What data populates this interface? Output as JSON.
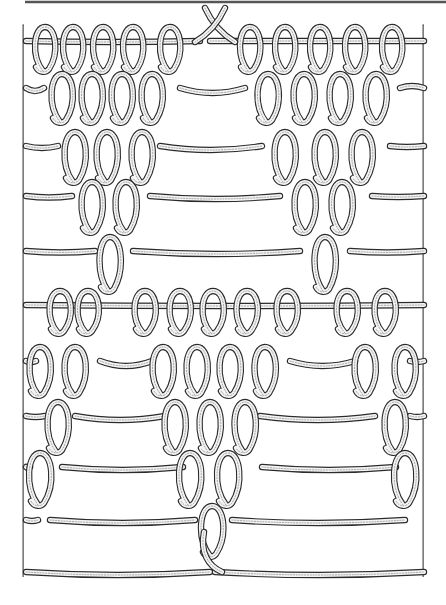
{
  "figure": {
    "type": "stitch-diagram",
    "colors": {
      "background": "#ffffff",
      "outline": "#2b2b2b",
      "fill": "#f4f4f4",
      "shading": "#9a9a9a",
      "rule": "#555555"
    },
    "canvas": {
      "width": 446,
      "height": 605
    },
    "top_rule": {
      "x1": 25,
      "x2": 446,
      "y": 2
    },
    "borders": {
      "left_x": 24,
      "right_x": 424,
      "top_y": 25,
      "bottom_y": 580
    },
    "yarn_width": 4.2,
    "rows": [
      {
        "y": 41,
        "segments": [
          [
            26,
            200,
            2
          ],
          [
            210,
            424,
            0
          ]
        ],
        "loops": [
          45,
          73,
          103,
          133,
          170,
          250,
          285,
          320,
          355,
          392
        ],
        "loop_h": 44,
        "loop_w": 19
      },
      {
        "y": 88,
        "segments": [
          [
            26,
            44,
            6
          ],
          [
            180,
            245,
            10
          ],
          [
            400,
            424,
            -4
          ]
        ],
        "loops": [
          62,
          92,
          122,
          152,
          268,
          304,
          340,
          376
        ],
        "loop_h": 48,
        "loop_w": 20
      },
      {
        "y": 146,
        "segments": [
          [
            26,
            58,
            4
          ],
          [
            160,
            262,
            8
          ],
          [
            390,
            424,
            2
          ]
        ],
        "loops": [
          75,
          107,
          142,
          285,
          325,
          362
        ],
        "loop_h": 50,
        "loop_w": 20
      },
      {
        "y": 196,
        "segments": [
          [
            26,
            72,
            3
          ],
          [
            150,
            280,
            6
          ],
          [
            372,
            424,
            2
          ]
        ],
        "loops": [
          92,
          126,
          305,
          342
        ],
        "loop_h": 50,
        "loop_w": 20
      },
      {
        "y": 251,
        "segments": [
          [
            26,
            95,
            3
          ],
          [
            133,
            300,
            6
          ],
          [
            350,
            424,
            3
          ]
        ],
        "loops": [
          110,
          325
        ],
        "loop_h": 54,
        "loop_w": 20
      },
      {
        "y": 305,
        "segments": [
          [
            26,
            424,
            2
          ]
        ],
        "loops": [
          60,
          88,
          145,
          180,
          213,
          247,
          287,
          347,
          385
        ],
        "loop_h": 42,
        "loop_w": 20
      },
      {
        "y": 361,
        "segments": [
          [
            26,
            36,
            2
          ],
          [
            100,
            152,
            10
          ],
          [
            290,
            355,
            10
          ],
          [
            410,
            424,
            2
          ]
        ],
        "loops": [
          40,
          75,
          163,
          197,
          230,
          265,
          365,
          405
        ],
        "loop_h": 48,
        "loop_w": 20
      },
      {
        "y": 416,
        "segments": [
          [
            26,
            45,
            2
          ],
          [
            75,
            165,
            8
          ],
          [
            260,
            375,
            8
          ],
          [
            410,
            424,
            2
          ]
        ],
        "loops": [
          58,
          175,
          210,
          245,
          395
        ],
        "loop_h": 50,
        "loop_w": 20
      },
      {
        "y": 467,
        "segments": [
          [
            26,
            30,
            2
          ],
          [
            62,
            183,
            6
          ],
          [
            262,
            396,
            6
          ]
        ],
        "loops": [
          40,
          190,
          228,
          405
        ],
        "loop_h": 52,
        "loop_w": 21
      },
      {
        "y": 520,
        "segments": [
          [
            26,
            38,
            2
          ],
          [
            50,
            195,
            6
          ],
          [
            232,
            405,
            6
          ]
        ],
        "loops": [
          212
        ],
        "loop_h": 50,
        "loop_w": 21
      },
      {
        "y": 572,
        "segments": [
          [
            26,
            210,
            6
          ],
          [
            215,
            424,
            6
          ]
        ],
        "loops": [],
        "loop_h": 0,
        "loop_w": 0
      }
    ],
    "crossing_top": {
      "x": 215,
      "y": 20,
      "span": 20
    },
    "crossing_bottom": {
      "x": 212,
      "y": 560
    }
  }
}
